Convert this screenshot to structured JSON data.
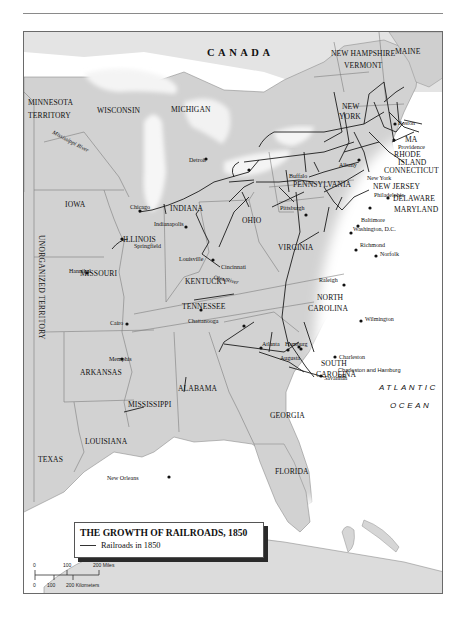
{
  "page": {
    "header_rule": true
  },
  "map": {
    "title": "THE GROWTH OF RAILROADS, 1850",
    "legend": {
      "items": [
        {
          "symbol": "line",
          "color": "#333333",
          "label": "Railroads in 1850"
        }
      ]
    },
    "scale_bar": {
      "miles_ticks": [
        "0",
        "100",
        "200 Miles"
      ],
      "km_ticks": [
        "0",
        "100",
        "200 Kilometers"
      ]
    },
    "countries": [
      "CANADA"
    ],
    "ocean": [
      "ATLANTIC",
      "OCEAN"
    ],
    "states": {
      "minnesota": "MINNESOTA",
      "minnesota2": "TERRITORY",
      "wisconsin": "WISCONSIN",
      "michigan": "MICHIGAN",
      "iowa": "IOWA",
      "illinois": "ILLINOIS",
      "indiana": "INDIANA",
      "ohio": "OHIO",
      "missouri": "MISSOURI",
      "kentucky": "KENTUCKY",
      "tennessee": "TENNESSEE",
      "arkansas": "ARKANSAS",
      "mississippi": "MISSISSIPPI",
      "alabama": "ALABAMA",
      "georgia": "GEORGIA",
      "florida": "FLORIDA",
      "louisiana": "LOUISIANA",
      "texas": "TEXAS",
      "virginia": "VIRGINIA",
      "nc1": "NORTH",
      "nc2": "CAROLINA",
      "sc1": "SOUTH",
      "sc2": "CAROLINA",
      "pennsylvania": "PENNSYLVANIA",
      "ny1": "NEW",
      "ny2": "YORK",
      "nh": "NEW HAMPSHIRE",
      "vermont": "VERMONT",
      "maine": "MAINE",
      "ma": "MA",
      "ri1": "RHODE",
      "ri2": "ISLAND",
      "connecticut": "CONNECTICUT",
      "new_jersey": "NEW JERSEY",
      "delaware": "DELAWARE",
      "maryland": "MARYLAND",
      "unorganized": "UNORGANIZED TERRITORY"
    },
    "rivers": {
      "mississippi": "Mississippi River",
      "ohio": "Ohio River"
    },
    "cities": {
      "chicago": "Chicago",
      "detroit": "Detroit",
      "buffalo": "Buffalo",
      "albany": "Albany",
      "boston": "Boston",
      "providence": "Providence",
      "new_york": "New York",
      "philadelphia": "Philadelphia",
      "pittsburgh": "Pittsburgh",
      "baltimore": "Baltimore",
      "washington": "Washington, D.C.",
      "richmond": "Richmond",
      "norfolk": "Norfolk",
      "raleigh": "Raleigh",
      "wilmington": "Wilmington",
      "charleston": "Charleston",
      "savannah": "Savannah",
      "augusta": "Augusta",
      "hamburg": "Hamburg",
      "atlanta": "Atlanta",
      "chattanooga": "Chattanooga",
      "memphis": "Memphis",
      "new_orleans": "New Orleans",
      "cairo": "Cairo",
      "louisville": "Louisville",
      "cincinnati": "Cincinnati",
      "indianapolis": "Indianapolis",
      "springfield": "Springfield",
      "hannibal": "Hannibal"
    },
    "annotations": {
      "charleston_hamburg_rr": "Charleston and Hamburg RR"
    }
  }
}
